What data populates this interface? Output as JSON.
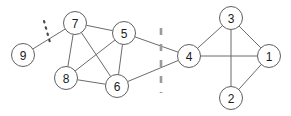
{
  "figure": {
    "title": "",
    "canvas": {
      "width": 291,
      "height": 116,
      "background": "#ffffff"
    },
    "colors": {
      "node_fill": "#ffffff",
      "node_stroke": "#5f5f5f",
      "node_label": "#1b1b1b",
      "edge": "#6b6b6b",
      "separator": "#9a9a9a",
      "slash": "#4a4a4a"
    }
  },
  "graph": {
    "node_radius": 11.5,
    "nodes": [
      {
        "id": "9",
        "label": "9",
        "x": 23,
        "y": 55,
        "cluster": "left"
      },
      {
        "id": "7",
        "label": "7",
        "x": 75,
        "y": 23,
        "cluster": "left"
      },
      {
        "id": "5",
        "label": "5",
        "x": 124,
        "y": 33,
        "cluster": "left"
      },
      {
        "id": "8",
        "label": "8",
        "x": 66,
        "y": 78,
        "cluster": "left"
      },
      {
        "id": "6",
        "label": "6",
        "x": 117,
        "y": 86,
        "cluster": "left"
      },
      {
        "id": "4",
        "label": "4",
        "x": 189,
        "y": 56,
        "cluster": "right"
      },
      {
        "id": "3",
        "label": "3",
        "x": 231,
        "y": 18,
        "cluster": "right"
      },
      {
        "id": "1",
        "label": "1",
        "x": 269,
        "y": 56,
        "cluster": "right"
      },
      {
        "id": "2",
        "label": "2",
        "x": 231,
        "y": 98,
        "cluster": "right"
      }
    ],
    "edges": [
      {
        "source": "9",
        "target": "7",
        "cut": true
      },
      {
        "source": "7",
        "target": "5",
        "cut": false
      },
      {
        "source": "7",
        "target": "8",
        "cut": false
      },
      {
        "source": "7",
        "target": "6",
        "cut": false
      },
      {
        "source": "8",
        "target": "5",
        "cut": false
      },
      {
        "source": "8",
        "target": "6",
        "cut": false
      },
      {
        "source": "5",
        "target": "6",
        "cut": false
      },
      {
        "source": "5",
        "target": "4",
        "cut": true
      },
      {
        "source": "6",
        "target": "4",
        "cut": true
      },
      {
        "source": "4",
        "target": "3",
        "cut": false
      },
      {
        "source": "4",
        "target": "1",
        "cut": false
      },
      {
        "source": "3",
        "target": "1",
        "cut": false
      },
      {
        "source": "3",
        "target": "2",
        "cut": false
      },
      {
        "source": "1",
        "target": "2",
        "cut": false
      }
    ],
    "cut_markers": [
      {
        "id": "cluster-separator",
        "style": "dashed-vertical",
        "x": 161,
        "y_start": 28,
        "y_end": 93,
        "dash_pattern": "7 9"
      },
      {
        "id": "edge-cut-slash",
        "style": "dotted-diagonal",
        "x1": 44,
        "y1": 21,
        "x2": 51,
        "y2": 46,
        "dash_pattern": "1.5 5"
      }
    ]
  }
}
